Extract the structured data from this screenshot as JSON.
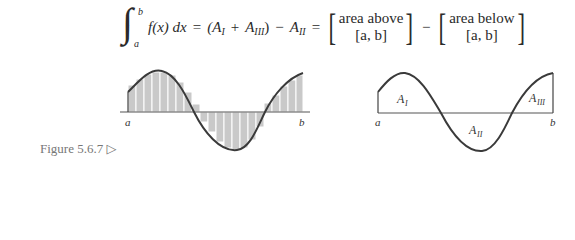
{
  "equation": {
    "integral_lower": "a",
    "integral_upper": "b",
    "integrand": "f(x) dx",
    "equals": "=",
    "term1": "(A",
    "term1_sub": "I",
    "plus": "+",
    "term2": "A",
    "term2_sub": "III",
    "term2_close": ")",
    "minus": "−",
    "term3": "A",
    "term3_sub": "II",
    "equals2": "=",
    "bracket1_line1": "area above",
    "bracket1_line2": "[a, b]",
    "minus2": "−",
    "bracket2_line1": "area below",
    "bracket2_line2": "[a, b]"
  },
  "figures": {
    "left": {
      "label_a": "a",
      "label_b": "b",
      "description": "Riemann sum rectangles under oscillating curve"
    },
    "right": {
      "label_a": "a",
      "label_b": "b",
      "regions": [
        {
          "name": "A",
          "sub": "I"
        },
        {
          "name": "A",
          "sub": "II"
        },
        {
          "name": "A",
          "sub": "III"
        }
      ]
    }
  },
  "caption": "Figure 5.6.7 ▷",
  "colors": {
    "curve": "#3a3a3a",
    "bars": "#c9c9c9",
    "axis": "#555555"
  }
}
